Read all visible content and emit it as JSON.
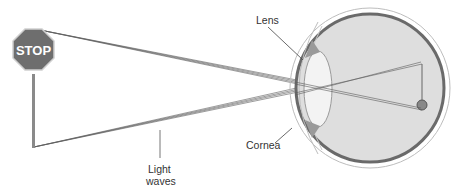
{
  "diagram": {
    "sign_text": "STOP",
    "labels": {
      "lens": "Lens",
      "cornea": "Cornea",
      "light_waves_line1": "Light",
      "light_waves_line2": "waves"
    },
    "colors": {
      "sign": "#6e6e6e",
      "eye_fill": "#dcdcdc",
      "eye_outline": "#6a6a6a",
      "rays": "#555555"
    }
  }
}
